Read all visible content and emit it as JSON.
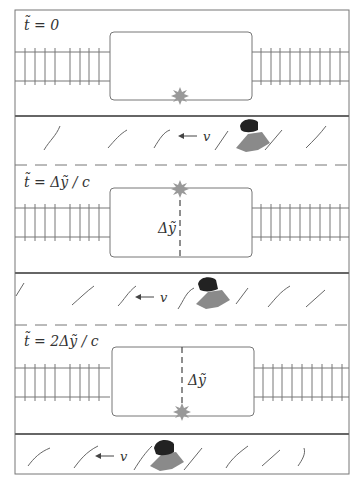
{
  "figure": {
    "panels": [
      {
        "time_label": "t̃ = 0",
        "flash_position": "bottom",
        "dy_label": "",
        "velocity_label": "← v"
      },
      {
        "time_label": "t̃ = Δỹ / c",
        "flash_position": "top",
        "dy_label": "Δỹ",
        "velocity_label": "← v"
      },
      {
        "time_label": "t̃ = 2Δỹ / c",
        "flash_position": "bottom",
        "dy_label": "Δỹ",
        "velocity_label": "← v"
      }
    ],
    "colors": {
      "line": "#666666",
      "flash": "#999999",
      "observer_head": "#222222",
      "observer_body": "#8a8a8a"
    }
  }
}
